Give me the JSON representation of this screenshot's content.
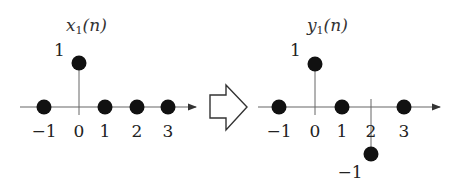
{
  "left_plot": {
    "title": "x",
    "title_sub": "1",
    "title_arg": "(n)",
    "ticks": [
      "−1",
      "0",
      "1",
      "2",
      "3"
    ],
    "value_label": "1",
    "samples": [
      {
        "n": -1,
        "value": 0
      },
      {
        "n": 0,
        "value": 1
      },
      {
        "n": 1,
        "value": 0
      },
      {
        "n": 2,
        "value": 0
      },
      {
        "n": 3,
        "value": 0
      }
    ]
  },
  "transform_arrow": {
    "icon": "hollow-right-arrow-icon"
  },
  "right_plot": {
    "title": "y",
    "title_sub": "1",
    "title_arg": "(n)",
    "ticks": [
      "−1",
      "0",
      "1",
      "2",
      "3"
    ],
    "value_label_pos": "1",
    "value_label_neg": "−1",
    "samples": [
      {
        "n": -1,
        "value": 0
      },
      {
        "n": 0,
        "value": 1
      },
      {
        "n": 1,
        "value": 0
      },
      {
        "n": 2,
        "value": -1
      },
      {
        "n": 3,
        "value": 0
      }
    ]
  },
  "colors": {
    "stroke": "#555555",
    "dot": "#111111",
    "text": "#222222"
  }
}
